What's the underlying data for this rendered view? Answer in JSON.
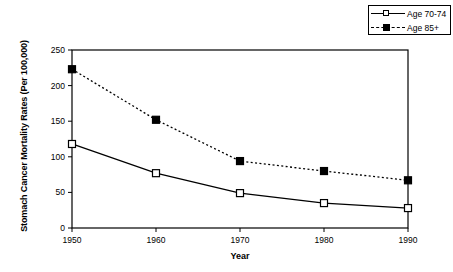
{
  "chart_data": {
    "type": "line",
    "title": "",
    "xlabel": "Year",
    "ylabel": "Stomach Cancer Mortality Rates (Per 100,000)",
    "x": [
      1950,
      1960,
      1970,
      1980,
      1990
    ],
    "xtick_labels": [
      "1950",
      "1960",
      "1970",
      "1980",
      "1990"
    ],
    "ytick_labels": [
      "0",
      "50",
      "100",
      "150",
      "200",
      "250"
    ],
    "yticks": [
      0,
      50,
      100,
      150,
      200,
      250
    ],
    "xlim": [
      1950,
      1990
    ],
    "ylim": [
      0,
      250
    ],
    "grid": false,
    "legend_position": "top-right",
    "series": [
      {
        "name": "Age 70-74",
        "values": [
          118,
          77,
          49,
          35,
          28
        ],
        "line_style": "solid",
        "marker": "open-square",
        "color": "#000000"
      },
      {
        "name": "Age 85+",
        "values": [
          223,
          152,
          94,
          80,
          67
        ],
        "line_style": "dotted",
        "marker": "filled-square",
        "color": "#000000"
      }
    ]
  },
  "legend": {
    "entries": [
      {
        "label": "Age 70-74"
      },
      {
        "label": "Age 85+"
      }
    ]
  },
  "colors": {
    "ink": "#000000",
    "background": "#ffffff"
  }
}
